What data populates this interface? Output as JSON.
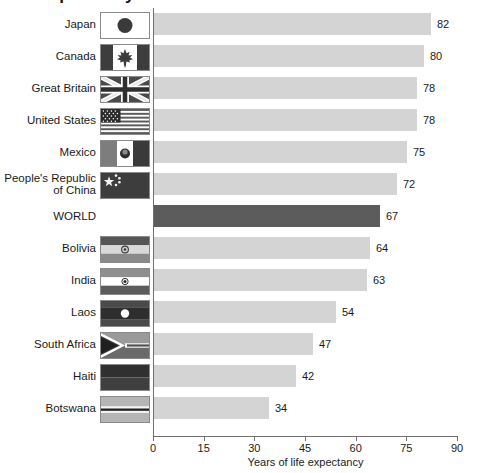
{
  "title": "Life expectancy at birth",
  "chart_data": {
    "type": "bar",
    "orientation": "horizontal",
    "title": "Life expectancy at birth",
    "xlabel": "Years of life expectancy",
    "ylabel": "",
    "xlim": [
      0,
      90
    ],
    "xticks": [
      0,
      15,
      30,
      45,
      60,
      75,
      90
    ],
    "grid": false,
    "legend": null,
    "bar_color": "#d4d4d4",
    "highlight_color": "#5c5c5c",
    "highlight_category": "WORLD",
    "categories": [
      "Japan",
      "Canada",
      "Great Britain",
      "United States",
      "Mexico",
      "People's Republic of China",
      "WORLD",
      "Bolivia",
      "India",
      "Laos",
      "South Africa",
      "Haiti",
      "Botswana"
    ],
    "values": [
      82,
      80,
      78,
      78,
      75,
      72,
      67,
      64,
      63,
      54,
      47,
      42,
      34
    ]
  },
  "rows": [
    {
      "label": "Japan",
      "label_line2": "",
      "value": 82,
      "flag": "flag-japan",
      "highlight": false
    },
    {
      "label": "Canada",
      "label_line2": "",
      "value": 80,
      "flag": "flag-canada",
      "highlight": false
    },
    {
      "label": "Great Britain",
      "label_line2": "",
      "value": 78,
      "flag": "flag-great-britain",
      "highlight": false
    },
    {
      "label": "United States",
      "label_line2": "",
      "value": 78,
      "flag": "flag-united-states",
      "highlight": false
    },
    {
      "label": "Mexico",
      "label_line2": "",
      "value": 75,
      "flag": "flag-mexico",
      "highlight": false
    },
    {
      "label": "People's Republic",
      "label_line2": "of China",
      "value": 72,
      "flag": "flag-china",
      "highlight": false
    },
    {
      "label": "WORLD",
      "label_line2": "",
      "value": 67,
      "flag": null,
      "highlight": true
    },
    {
      "label": "Bolivia",
      "label_line2": "",
      "value": 64,
      "flag": "flag-bolivia",
      "highlight": false
    },
    {
      "label": "India",
      "label_line2": "",
      "value": 63,
      "flag": "flag-india",
      "highlight": false
    },
    {
      "label": "Laos",
      "label_line2": "",
      "value": 54,
      "flag": "flag-laos",
      "highlight": false
    },
    {
      "label": "South Africa",
      "label_line2": "",
      "value": 47,
      "flag": "flag-south-africa",
      "highlight": false
    },
    {
      "label": "Haiti",
      "label_line2": "",
      "value": 42,
      "flag": "flag-haiti",
      "highlight": false
    },
    {
      "label": "Botswana",
      "label_line2": "",
      "value": 34,
      "flag": "flag-botswana",
      "highlight": false
    }
  ],
  "axis": {
    "ticks": [
      "0",
      "15",
      "30",
      "45",
      "60",
      "75",
      "90"
    ],
    "xlabel": "Years of life expectancy"
  }
}
